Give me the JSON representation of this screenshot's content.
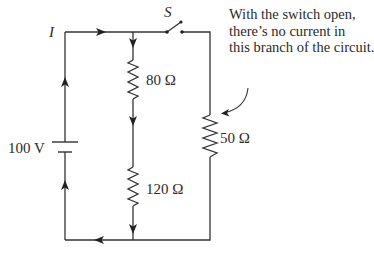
{
  "diagram": {
    "type": "circuit",
    "current_label": "I",
    "switch_label": "S",
    "switch_state": "open",
    "battery": {
      "label": "100 V"
    },
    "resistors": [
      {
        "id": "r1",
        "label": "80 Ω",
        "branch": "middle-top"
      },
      {
        "id": "r2",
        "label": "120 Ω",
        "branch": "middle-bottom"
      },
      {
        "id": "r3",
        "label": "50 Ω",
        "branch": "right"
      }
    ],
    "annotation": {
      "lines": [
        "With the switch open,",
        "there’s no current in",
        "this branch of the circuit."
      ]
    },
    "colors": {
      "wire": "#333333",
      "text": "#2a2a2a",
      "background": "#ffffff"
    }
  }
}
